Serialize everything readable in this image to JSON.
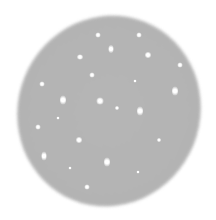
{
  "image": {
    "description": "Gray tilted elliptical disk with scattered bright point spots",
    "background_color": "#ffffff",
    "disk_color": "#b4b4b4",
    "spot_color": "#ffffff"
  },
  "spots": [
    {
      "x": 98,
      "y": 35,
      "w": 5,
      "h": 5
    },
    {
      "x": 139,
      "y": 35,
      "w": 5,
      "h": 5
    },
    {
      "x": 111,
      "y": 49,
      "w": 5,
      "h": 8
    },
    {
      "x": 80,
      "y": 57,
      "w": 6,
      "h": 5
    },
    {
      "x": 148,
      "y": 55,
      "w": 6,
      "h": 6
    },
    {
      "x": 180,
      "y": 65,
      "w": 5,
      "h": 5
    },
    {
      "x": 92,
      "y": 75,
      "w": 5,
      "h": 5
    },
    {
      "x": 42,
      "y": 84,
      "w": 5,
      "h": 5
    },
    {
      "x": 135,
      "y": 81,
      "w": 3,
      "h": 3
    },
    {
      "x": 175,
      "y": 91,
      "w": 6,
      "h": 9
    },
    {
      "x": 63,
      "y": 100,
      "w": 6,
      "h": 9
    },
    {
      "x": 100,
      "y": 101,
      "w": 7,
      "h": 7
    },
    {
      "x": 117,
      "y": 108,
      "w": 4,
      "h": 4
    },
    {
      "x": 140,
      "y": 111,
      "w": 6,
      "h": 9
    },
    {
      "x": 38,
      "y": 127,
      "w": 5,
      "h": 5
    },
    {
      "x": 79,
      "y": 140,
      "w": 6,
      "h": 6
    },
    {
      "x": 159,
      "y": 140,
      "w": 4,
      "h": 4
    },
    {
      "x": 44,
      "y": 156,
      "w": 5,
      "h": 9
    },
    {
      "x": 107,
      "y": 162,
      "w": 6,
      "h": 9
    },
    {
      "x": 87,
      "y": 187,
      "w": 5,
      "h": 5
    },
    {
      "x": 138,
      "y": 172,
      "w": 3,
      "h": 3
    },
    {
      "x": 58,
      "y": 118,
      "w": 3,
      "h": 3
    },
    {
      "x": 70,
      "y": 168,
      "w": 3,
      "h": 3
    }
  ]
}
